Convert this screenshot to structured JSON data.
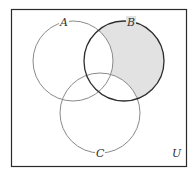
{
  "diagram": {
    "type": "venn",
    "universe_label": "U",
    "sets": [
      {
        "label": "A",
        "cx": 73,
        "cy": 61,
        "r": 40,
        "stroke": "#8a8a8a"
      },
      {
        "label": "B",
        "cx": 124,
        "cy": 61,
        "r": 40,
        "stroke": "#2e2e2e"
      },
      {
        "label": "C",
        "cx": 100,
        "cy": 113,
        "r": 40,
        "stroke": "#8a8a8a"
      }
    ],
    "shaded_region": "B - (A ∪ C)",
    "colors": {
      "shade": "#e2e2e2",
      "border": "#2a2a2a",
      "background": "#ffffff"
    }
  }
}
